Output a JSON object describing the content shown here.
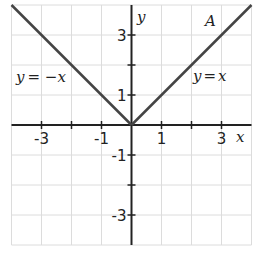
{
  "chart_data": {
    "type": "line",
    "title": "",
    "xlabel": "x",
    "ylabel": "y",
    "xlim": [
      -4,
      4
    ],
    "ylim": [
      -4,
      4
    ],
    "grid": true,
    "xticks": [
      -3,
      -2,
      -1,
      0,
      1,
      2,
      3
    ],
    "yticks": [
      -3,
      -2,
      -1,
      0,
      1,
      2,
      3
    ],
    "xtick_labels": [
      {
        "value": -3,
        "text": "-3"
      },
      {
        "value": -1,
        "text": "-1"
      },
      {
        "value": 1,
        "text": "1"
      },
      {
        "value": 3,
        "text": "3"
      }
    ],
    "ytick_labels": [
      {
        "value": 3,
        "text": "3"
      },
      {
        "value": 1,
        "text": "1"
      },
      {
        "value": -1,
        "text": "-1"
      },
      {
        "value": -3,
        "text": "-3"
      }
    ],
    "series": [
      {
        "name": "y = −x",
        "domain": "x ≤ 0",
        "x": [
          -4,
          0
        ],
        "y": [
          4,
          0
        ]
      },
      {
        "name": "y = x",
        "domain": "x ≥ 0",
        "x": [
          0,
          4
        ],
        "y": [
          0,
          4
        ]
      }
    ],
    "annotations": [
      {
        "text": "A",
        "x": 2.65,
        "y": 3.35
      },
      {
        "text": "y = −x",
        "x": -3.2,
        "y": 1.55
      },
      {
        "text": "y = x",
        "x": 2.55,
        "y": 1.55
      }
    ]
  },
  "labels": {
    "x_axis": "x",
    "y_axis": "y",
    "curve_name": "A",
    "left_eq_lhs": "y",
    "left_eq_rhs": "= −",
    "left_eq_var": "x",
    "right_eq_lhs": "y",
    "right_eq_rhs": "=",
    "right_eq_var": "x"
  },
  "colors": {
    "grid": "#dcdcdc",
    "axis": "#222222",
    "curve": "#444444"
  }
}
